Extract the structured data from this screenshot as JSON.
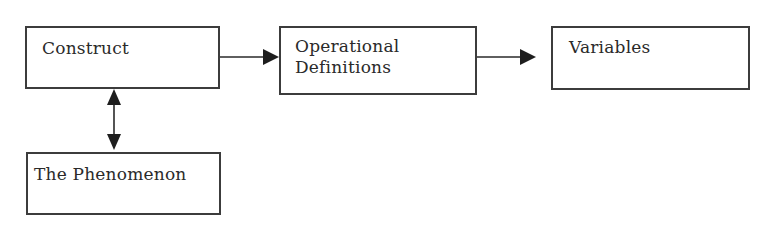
{
  "diagram": {
    "type": "flowchart",
    "nodes": [
      {
        "id": "construct",
        "label": "Construct"
      },
      {
        "id": "operational_definitions",
        "label": "Operational\nDefinitions"
      },
      {
        "id": "variables",
        "label": "Variables"
      },
      {
        "id": "phenomenon",
        "label": "The Phenomenon"
      }
    ],
    "edges": [
      {
        "from": "construct",
        "to": "operational_definitions",
        "direction": "forward"
      },
      {
        "from": "operational_definitions",
        "to": "variables",
        "direction": "forward"
      },
      {
        "from": "construct",
        "to": "phenomenon",
        "direction": "bidirectional"
      }
    ],
    "colors": {
      "stroke": "#3c3c3c",
      "arrow": "#1e1e1e",
      "text": "#2a2a2a",
      "background": "#ffffff"
    }
  }
}
